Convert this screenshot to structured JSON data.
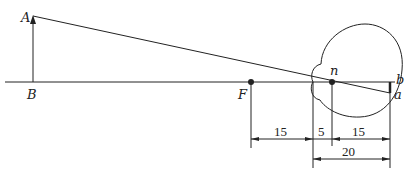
{
  "diagram": {
    "type": "reduced-eye optics diagram",
    "colors": {
      "line": "#222222",
      "background": "#ffffff"
    },
    "points": {
      "A": "A",
      "B": "B",
      "F": "F",
      "n": "n",
      "b": "b",
      "a": "a"
    },
    "dimensions": {
      "F_to_front": "15",
      "front_to_n": "5",
      "n_to_retina": "15",
      "front_to_retina": "20"
    }
  }
}
